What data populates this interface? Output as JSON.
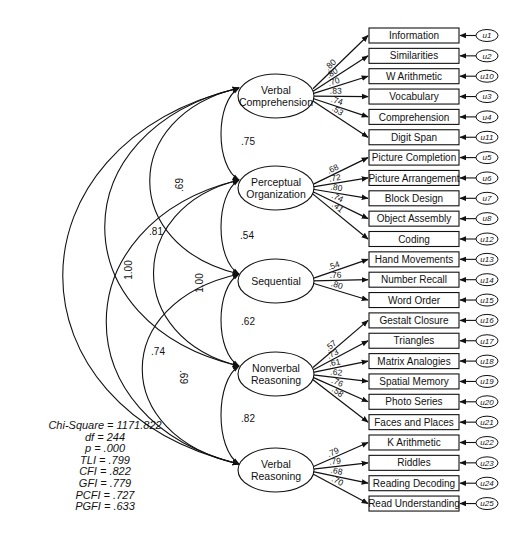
{
  "diagram": {
    "type": "structural-equation-model",
    "latent_factors": [
      {
        "id": "VC",
        "label_line1": "Verbal",
        "label_line2": "Comprehension"
      },
      {
        "id": "PO",
        "label_line1": "Perceptual",
        "label_line2": "Organization"
      },
      {
        "id": "SEQ",
        "label_line1": "Sequential",
        "label_line2": ""
      },
      {
        "id": "NR",
        "label_line1": "Nonverbal",
        "label_line2": "Reasoning"
      },
      {
        "id": "VR",
        "label_line1": "Verbal",
        "label_line2": "Reasoning"
      }
    ],
    "indicators": [
      {
        "label": "Information",
        "error": "u1",
        "factor": "VC",
        "loading": ".80"
      },
      {
        "label": "Similarities",
        "error": "u2",
        "factor": "VC",
        "loading": ".80"
      },
      {
        "label": "W Arithmetic",
        "error": "u10",
        "factor": "VC",
        "loading": ".70"
      },
      {
        "label": "Vocabulary",
        "error": "u3",
        "factor": "VC",
        "loading": ".83"
      },
      {
        "label": "Comprehension",
        "error": "u4",
        "factor": "VC",
        "loading": ".74"
      },
      {
        "label": "Digit Span",
        "error": "u11",
        "factor": "VC",
        "loading": ".53"
      },
      {
        "label": "Picture Completion",
        "error": "u5",
        "factor": "PO",
        "loading": ".68"
      },
      {
        "label": "Picture Arrangement",
        "error": "u6",
        "factor": "PO",
        "loading": ".72"
      },
      {
        "label": "Block Design",
        "error": "u7",
        "factor": "PO",
        "loading": ".80"
      },
      {
        "label": "Object Assembly",
        "error": "u8",
        "factor": "PO",
        "loading": ".74"
      },
      {
        "label": "Coding",
        "error": "u12",
        "factor": "PO",
        "loading": ".41"
      },
      {
        "label": "Hand Movements",
        "error": "u13",
        "factor": "SEQ",
        "loading": ".54"
      },
      {
        "label": "Number Recall",
        "error": "u14",
        "factor": "SEQ",
        "loading": ".76"
      },
      {
        "label": "Word Order",
        "error": "u15",
        "factor": "SEQ",
        "loading": ".80"
      },
      {
        "label": "Gestalt Closure",
        "error": "u16",
        "factor": "NR",
        "loading": ".57"
      },
      {
        "label": "Triangles",
        "error": "u17",
        "factor": "NR",
        "loading": ".73"
      },
      {
        "label": "Matrix Analogies",
        "error": "u18",
        "factor": "NR",
        "loading": ".61"
      },
      {
        "label": "Spatial Memory",
        "error": "u19",
        "factor": "NR",
        "loading": ".62"
      },
      {
        "label": "Photo Series",
        "error": "u20",
        "factor": "NR",
        "loading": ".76"
      },
      {
        "label": "Faces and Places",
        "error": "u21",
        "factor": "NR",
        "loading": ".58"
      },
      {
        "label": "K Arithmetic",
        "error": "u22",
        "factor": "VR",
        "loading": ".79"
      },
      {
        "label": "Riddles",
        "error": "u23",
        "factor": "VR",
        "loading": ".79"
      },
      {
        "label": "Reading Decoding",
        "error": "u24",
        "factor": "VR",
        "loading": ".68"
      },
      {
        "label": "Read Understanding",
        "error": "u25",
        "factor": "VR",
        "loading": ".70"
      }
    ],
    "correlations": [
      {
        "from": "VC",
        "to": "PO",
        "value": ".75"
      },
      {
        "from": "VC",
        "to": "SEQ",
        "value": ".69"
      },
      {
        "from": "VC",
        "to": "NR",
        "value": ".81"
      },
      {
        "from": "VC",
        "to": "VR",
        "value": "1.00"
      },
      {
        "from": "PO",
        "to": "SEQ",
        "value": ".54"
      },
      {
        "from": "PO",
        "to": "NR",
        "value": "1.00"
      },
      {
        "from": "PO",
        "to": "VR",
        "value": ".74"
      },
      {
        "from": "SEQ",
        "to": "NR",
        "value": ".62"
      },
      {
        "from": "SEQ",
        "to": "VR",
        "value": ".69"
      },
      {
        "from": "NR",
        "to": "VR",
        "value": ".82"
      }
    ]
  },
  "fit_indices": {
    "chi_square": "Chi-Square = 1171.822",
    "df": "df = 244",
    "p": "p = .000",
    "tli": "TLI = .799",
    "cfi": "CFI = .822",
    "gfi": "GFI = .779",
    "pcfi": "PCFI = .727",
    "pgfi": "PGFI = .633"
  }
}
